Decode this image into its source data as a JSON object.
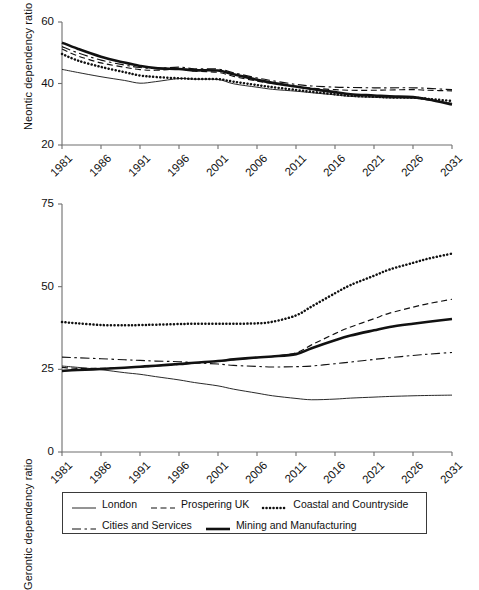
{
  "figure": {
    "panels": [
      {
        "id": "neontic",
        "ylabel": "Neontic dependency ratio",
        "yticks": [
          "20",
          "40",
          "60"
        ],
        "xticks": [
          "1981",
          "1986",
          "1991",
          "1996",
          "2001",
          "2006",
          "2011",
          "2016",
          "2021",
          "2026",
          "2031"
        ]
      },
      {
        "id": "gerontic",
        "ylabel": "Gerontic dependency ratio",
        "yticks": [
          "0",
          "25",
          "50",
          "75"
        ],
        "xticks": [
          "1981",
          "1986",
          "1991",
          "1996",
          "2001",
          "2006",
          "2011",
          "2016",
          "2021",
          "2026",
          "2031"
        ]
      }
    ]
  },
  "legend": {
    "rows": [
      [
        {
          "key": "london",
          "label": "London",
          "style": "solid-thin"
        },
        {
          "key": "prospering",
          "label": "Prospering UK",
          "style": "dashed"
        },
        {
          "key": "coastal",
          "label": "Coastal and Countryside",
          "style": "dotted"
        }
      ],
      [
        {
          "key": "cities",
          "label": "Cities and Services",
          "style": "dash-dot"
        },
        {
          "key": "mining",
          "label": "Mining and Manufacturing",
          "style": "solid-thick"
        }
      ]
    ]
  },
  "chart_data": [
    {
      "type": "line",
      "id": "neontic",
      "title": "",
      "xlabel": "",
      "ylabel": "Neontic dependency ratio",
      "xlim": [
        1981,
        2031
      ],
      "ylim": [
        20,
        60
      ],
      "yticks": [
        20,
        40,
        60
      ],
      "xticks": [
        1981,
        1986,
        1991,
        1996,
        2001,
        2006,
        2011,
        2016,
        2021,
        2026,
        2031
      ],
      "grid": false,
      "legend_position": "below-figure",
      "x": [
        1981,
        1983,
        1986,
        1989,
        1991,
        1993,
        1996,
        1998,
        2001,
        2003,
        2006,
        2008,
        2011,
        2013,
        2016,
        2018,
        2021,
        2023,
        2026,
        2028,
        2031
      ],
      "series": [
        {
          "name": "London",
          "style": "solid-thin",
          "values": [
            44.6,
            43.6,
            42.2,
            41.0,
            40.1,
            40.6,
            41.6,
            41.4,
            41.3,
            39.9,
            38.8,
            38.1,
            37.5,
            37.0,
            36.3,
            35.8,
            35.5,
            35.3,
            35.2,
            34.6,
            33.6
          ]
        },
        {
          "name": "Prospering UK",
          "style": "dashed",
          "values": [
            51.2,
            49.0,
            46.7,
            45.3,
            44.5,
            44.3,
            44.7,
            44.0,
            43.6,
            42.3,
            40.8,
            40.0,
            39.0,
            38.5,
            38.0,
            37.8,
            37.8,
            37.9,
            38.0,
            37.8,
            37.6
          ]
        },
        {
          "name": "Coastal and Countryside",
          "style": "dotted",
          "values": [
            49.6,
            47.5,
            45.4,
            43.7,
            42.6,
            42.1,
            41.7,
            41.5,
            41.4,
            40.6,
            39.5,
            38.8,
            37.9,
            37.3,
            36.5,
            36.0,
            35.7,
            35.5,
            35.4,
            35.0,
            34.3
          ]
        },
        {
          "name": "Cities and Services",
          "style": "dash-dot",
          "values": [
            52.0,
            50.0,
            47.6,
            46.0,
            45.2,
            44.9,
            45.3,
            44.8,
            44.7,
            43.5,
            41.8,
            40.9,
            39.7,
            39.2,
            38.8,
            38.7,
            38.6,
            38.6,
            38.6,
            38.4,
            38.0
          ]
        },
        {
          "name": "Mining and Manufacturing",
          "style": "solid-thick",
          "values": [
            53.3,
            51.3,
            48.7,
            46.8,
            45.7,
            45.0,
            44.7,
            44.3,
            44.2,
            43.0,
            41.2,
            40.2,
            39.0,
            38.2,
            37.2,
            36.5,
            36.1,
            35.8,
            35.6,
            34.8,
            33.2
          ]
        }
      ]
    },
    {
      "type": "line",
      "id": "gerontic",
      "title": "",
      "xlabel": "",
      "ylabel": "Gerontic dependency ratio",
      "xlim": [
        1981,
        2031
      ],
      "ylim": [
        0,
        75
      ],
      "yticks": [
        0,
        25,
        50,
        75
      ],
      "xticks": [
        1981,
        1986,
        1991,
        1996,
        2001,
        2006,
        2011,
        2016,
        2021,
        2026,
        2031
      ],
      "grid": false,
      "legend_position": "below-figure",
      "x": [
        1981,
        1983,
        1986,
        1989,
        1991,
        1993,
        1996,
        1998,
        2001,
        2003,
        2006,
        2008,
        2011,
        2013,
        2016,
        2018,
        2021,
        2023,
        2026,
        2028,
        2031
      ],
      "series": [
        {
          "name": "London",
          "style": "solid-thin",
          "values": [
            26.0,
            25.6,
            24.9,
            24.0,
            23.5,
            22.8,
            21.8,
            21.0,
            20.0,
            19.0,
            17.8,
            17.0,
            16.2,
            15.8,
            16.0,
            16.3,
            16.6,
            16.8,
            17.0,
            17.1,
            17.2
          ]
        },
        {
          "name": "Prospering UK",
          "style": "dashed",
          "values": [
            25.6,
            25.3,
            25.3,
            25.5,
            25.7,
            26.0,
            26.5,
            26.9,
            27.4,
            27.9,
            28.5,
            28.9,
            30.0,
            32.4,
            35.8,
            37.8,
            40.3,
            42.0,
            43.8,
            44.9,
            46.2
          ]
        },
        {
          "name": "Coastal and Countryside",
          "style": "dotted",
          "values": [
            39.3,
            38.9,
            38.4,
            38.3,
            38.4,
            38.5,
            38.7,
            38.8,
            38.8,
            38.8,
            38.9,
            39.4,
            41.3,
            44.0,
            48.0,
            50.5,
            53.3,
            55.2,
            57.2,
            58.5,
            60.0
          ]
        },
        {
          "name": "Cities and Services",
          "style": "dash-dot",
          "values": [
            28.7,
            28.5,
            28.2,
            27.9,
            27.7,
            27.5,
            27.3,
            27.0,
            26.6,
            26.2,
            25.9,
            25.7,
            25.8,
            26.0,
            26.7,
            27.2,
            28.0,
            28.5,
            29.2,
            29.6,
            30.1
          ]
        },
        {
          "name": "Mining and Manufacturing",
          "style": "solid-thick",
          "values": [
            24.5,
            24.8,
            25.1,
            25.5,
            25.8,
            26.1,
            26.6,
            27.0,
            27.5,
            28.0,
            28.6,
            28.9,
            29.6,
            31.4,
            33.8,
            35.2,
            36.8,
            37.8,
            38.8,
            39.4,
            40.2
          ]
        }
      ]
    }
  ]
}
